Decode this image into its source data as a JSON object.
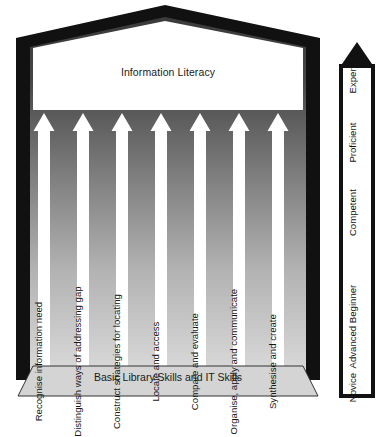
{
  "diagram": {
    "title": "Information Literacy",
    "base_label": "Basic Library Skills and IT Skills",
    "pillars": [
      {
        "label": "Recognise information need"
      },
      {
        "label": "Distinguish ways of addressing gap"
      },
      {
        "label": "Construct strategies for locating"
      },
      {
        "label": "Locate and access"
      },
      {
        "label": "Compare and evaluate"
      },
      {
        "label": "Organise, apply and communicate"
      },
      {
        "label": "Synthesise and create"
      }
    ],
    "scale": {
      "levels": [
        {
          "label": "Novice"
        },
        {
          "label": "Advanced Beginner"
        },
        {
          "label": "Competent"
        },
        {
          "label": "Proficient"
        },
        {
          "label": "Expert"
        }
      ],
      "direction_icon": "up-arrow-icon"
    },
    "colors": {
      "frame": "#111111",
      "background_top": "#3a3a3a",
      "background_bottom": "#d8d8d8",
      "pillar_fill": "#ffffff",
      "base_fill": "#d4d4d4",
      "text": "#151515"
    }
  }
}
